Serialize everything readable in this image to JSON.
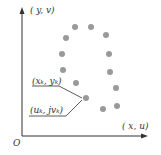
{
  "axes": {
    "y_label": "( y, v)",
    "x_label": "( x, u)",
    "origin": "O"
  },
  "annotations": {
    "point_label_1": "(x_k, y_k)",
    "point_label_1_display": "(xₖ, yₖ)",
    "point_label_2": "(u_k, jv_k)",
    "point_label_2_display": "(uₖ, jvₖ)"
  },
  "colors": {
    "dot": "#999999",
    "axis": "#333333"
  },
  "points": [
    [
      75,
      27
    ],
    [
      91,
      27
    ],
    [
      106,
      35
    ],
    [
      66,
      38
    ],
    [
      62,
      54
    ],
    [
      109,
      54
    ],
    [
      63,
      70
    ],
    [
      110,
      72
    ],
    [
      76,
      83
    ],
    [
      116,
      88
    ],
    [
      86,
      98
    ],
    [
      103,
      109
    ],
    [
      117,
      106
    ]
  ]
}
